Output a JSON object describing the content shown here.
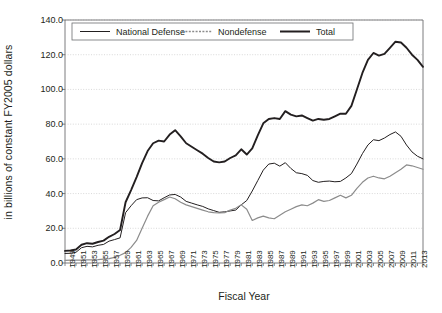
{
  "chart_data": {
    "type": "line",
    "title": "",
    "xlabel": "Fiscal Year",
    "ylabel": "in billions of constant FY2005 dollars",
    "ylim": [
      0.0,
      140.0
    ],
    "xlim": [
      1949,
      2014
    ],
    "yticks": [
      "0.0",
      "20.0",
      "40.0",
      "60.0",
      "80.0",
      "100.0",
      "120.0",
      "140.0"
    ],
    "ytick_values": [
      0,
      20,
      40,
      60,
      80,
      100,
      120,
      140
    ],
    "grid": "horizontal-dotted",
    "legend_position": "top-left-inside",
    "x": [
      1949,
      1950,
      1951,
      1952,
      1953,
      1954,
      1955,
      1956,
      1957,
      1958,
      1959,
      1960,
      1961,
      1962,
      1963,
      1964,
      1965,
      1966,
      1967,
      1968,
      1969,
      1970,
      1971,
      1972,
      1973,
      1974,
      1975,
      1976,
      1977,
      1978,
      1979,
      1980,
      1981,
      1982,
      1983,
      1984,
      1985,
      1986,
      1987,
      1988,
      1989,
      1990,
      1991,
      1992,
      1993,
      1994,
      1995,
      1996,
      1997,
      1998,
      1999,
      2000,
      2001,
      2002,
      2003,
      2004,
      2005,
      2006,
      2007,
      2008,
      2009,
      2010,
      2011,
      2012,
      2013,
      2014
    ],
    "xticks": [
      "1949",
      "1951",
      "1953",
      "1955",
      "1957",
      "1959",
      "1961",
      "1963",
      "1965",
      "1967",
      "1969",
      "1971",
      "1973",
      "1975",
      "1977",
      "1979",
      "1981",
      "1983",
      "1985",
      "1987",
      "1989",
      "1991",
      "1993",
      "1995",
      "1997",
      "1999",
      "2001",
      "2003",
      "2005",
      "2007",
      "2009",
      "2011",
      "2013"
    ],
    "series": [
      {
        "name": "National Defense",
        "color": "#231f20",
        "style": "solid-thin",
        "values": [
          5.5,
          5.6,
          6.2,
          8.8,
          9.6,
          9.3,
          10.2,
          10.7,
          12.6,
          13.5,
          14.5,
          29.0,
          33.0,
          36.5,
          37.5,
          37.6,
          36.0,
          35.8,
          37.6,
          39.2,
          39.5,
          38.0,
          35.5,
          34.5,
          33.5,
          32.6,
          31.2,
          30.2,
          29.2,
          29.5,
          30.0,
          30.5,
          33.5,
          36.0,
          41.5,
          47.5,
          53.5,
          57.0,
          57.5,
          55.8,
          57.8,
          54.5,
          52.0,
          51.5,
          50.5,
          47.5,
          46.5,
          47.0,
          47.2,
          46.8,
          47.0,
          49.0,
          51.5,
          57.0,
          63.0,
          68.0,
          71.0,
          70.5,
          72.0,
          74.0,
          75.5,
          73.0,
          68.0,
          64.0,
          61.5,
          60.0
        ]
      },
      {
        "name": "Nondefense",
        "color": "#8c8c8c",
        "style": "dashed-gray",
        "values": [
          1.5,
          1.6,
          1.6,
          1.7,
          1.8,
          1.8,
          1.9,
          2.2,
          2.5,
          3.2,
          4.5,
          6.0,
          9.0,
          13.0,
          20.0,
          27.0,
          33.0,
          35.0,
          36.5,
          38.0,
          37.0,
          35.0,
          33.5,
          32.5,
          31.5,
          30.5,
          29.5,
          29.0,
          28.8,
          29.0,
          30.5,
          31.5,
          33.5,
          31.0,
          24.5,
          26.0,
          27.0,
          26.0,
          25.5,
          27.5,
          29.5,
          31.0,
          32.5,
          33.5,
          33.0,
          34.5,
          36.5,
          35.5,
          36.0,
          37.5,
          39.0,
          37.5,
          39.0,
          43.0,
          46.5,
          49.0,
          50.0,
          49.0,
          48.5,
          50.0,
          52.0,
          54.0,
          56.5,
          56.0,
          55.0,
          54.0
        ]
      },
      {
        "name": "Total",
        "color": "#231f20",
        "style": "solid-thick",
        "values": [
          7.0,
          7.2,
          7.8,
          10.5,
          11.4,
          11.1,
          12.1,
          12.9,
          15.1,
          16.7,
          19.0,
          35.0,
          42.0,
          49.5,
          57.5,
          64.5,
          69.0,
          70.5,
          70.0,
          74.0,
          76.5,
          73.0,
          69.0,
          67.0,
          65.0,
          63.0,
          60.5,
          58.5,
          58.0,
          58.5,
          60.5,
          62.0,
          65.5,
          62.5,
          66.0,
          73.5,
          80.5,
          83.0,
          83.5,
          83.0,
          87.5,
          85.5,
          84.5,
          85.0,
          83.5,
          82.0,
          83.0,
          82.5,
          83.0,
          84.5,
          86.0,
          86.0,
          90.5,
          100.0,
          109.5,
          117.0,
          121.0,
          119.5,
          120.5,
          124.0,
          127.5,
          127.0,
          124.0,
          120.0,
          117.0,
          113.0
        ]
      }
    ]
  }
}
